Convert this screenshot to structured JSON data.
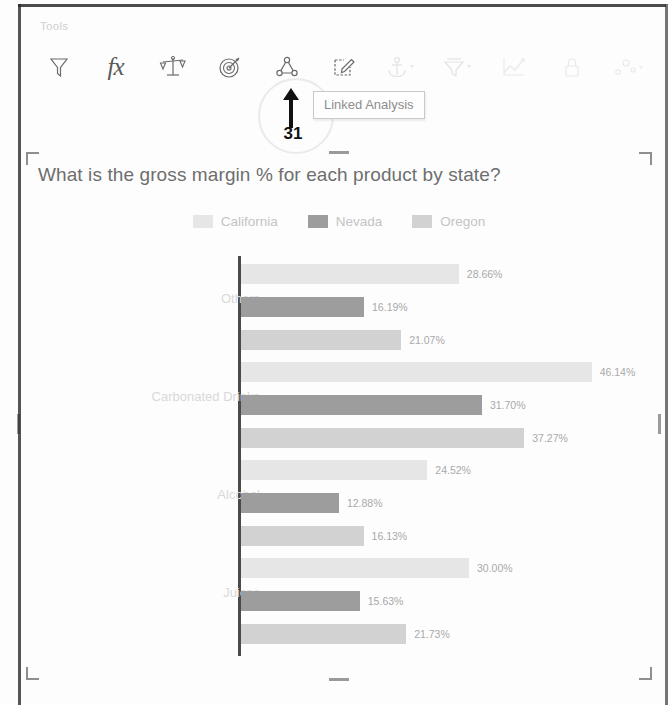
{
  "toolbar": {
    "group_label": "Tools",
    "items": [
      {
        "name": "filter-icon",
        "label": "Filter",
        "state": "enabled"
      },
      {
        "name": "function-icon",
        "label": "fx",
        "state": "enabled"
      },
      {
        "name": "balance-scales-icon",
        "label": "Compare",
        "state": "enabled"
      },
      {
        "name": "target-icon",
        "label": "Target",
        "state": "enabled"
      },
      {
        "name": "linked-analysis-icon",
        "label": "Linked Analysis",
        "state": "enabled"
      },
      {
        "name": "edit-pencil-icon",
        "label": "Edit",
        "state": "enabled"
      },
      {
        "name": "anchor-icon",
        "label": "Anchor",
        "state": "disabled"
      },
      {
        "name": "drill-icon",
        "label": "Drill",
        "state": "disabled"
      },
      {
        "name": "trend-line-icon",
        "label": "Trend",
        "state": "disabled"
      },
      {
        "name": "lock-icon",
        "label": "Lock",
        "state": "disabled"
      },
      {
        "name": "scatter-icon",
        "label": "Scatter",
        "state": "disabled"
      }
    ]
  },
  "tooltip": {
    "text": "Linked Analysis"
  },
  "annotation": {
    "step_number": "31",
    "arrow": "up-arrow"
  },
  "panel": {
    "title": "What is the gross margin % for each product by state?"
  },
  "colors": {
    "california": "#e6e6e6",
    "nevada": "#9d9d9d",
    "oregon": "#d2d2d2",
    "axis": "#4a4a4a",
    "annotation": "#111111"
  },
  "chart_data": {
    "type": "bar",
    "orientation": "horizontal",
    "title": "What is the gross margin % for each product by state?",
    "xlabel": "",
    "ylabel": "",
    "grid": false,
    "legend_position": "top-center",
    "value_suffix": "%",
    "categories": [
      "Others",
      "Carbonated Drinks",
      "Alcohol",
      "Juices"
    ],
    "series": [
      {
        "name": "California",
        "color": "#e6e6e6",
        "values": [
          28.66,
          46.14,
          24.52,
          30.0
        ],
        "labels": [
          "28.66%",
          "46.14%",
          "24.52%",
          "30.00%"
        ]
      },
      {
        "name": "Nevada",
        "color": "#9d9d9d",
        "values": [
          16.19,
          31.7,
          12.88,
          15.63
        ],
        "labels": [
          "16.19%",
          "31.70%",
          "12.88%",
          "15.63%"
        ]
      },
      {
        "name": "Oregon",
        "color": "#d2d2d2",
        "values": [
          21.07,
          37.27,
          16.13,
          21.73
        ],
        "labels": [
          "21.07%",
          "37.27%",
          "16.13%",
          "21.73%"
        ]
      }
    ],
    "xlim": [
      0,
      50
    ]
  }
}
